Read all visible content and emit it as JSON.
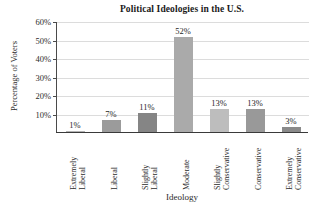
{
  "chart_data": {
    "type": "bar",
    "title": "Political Ideologies in the U.S.",
    "xlabel": "Ideology",
    "ylabel": "Percentage of Voters",
    "categories": [
      "Extremely Liberal",
      "Liberal",
      "Slightly Liberal",
      "Moderate",
      "Slightly Conservative",
      "Conservative",
      "Extremely Conservative"
    ],
    "category_lines": [
      [
        "Extremely",
        "Liberal"
      ],
      [
        "Liberal"
      ],
      [
        "Slightly",
        "Liberal"
      ],
      [
        "Moderate"
      ],
      [
        "Slightly",
        "Conservative"
      ],
      [
        "Conservative"
      ],
      [
        "Extremely",
        "Conservative"
      ]
    ],
    "values": [
      1,
      7,
      11,
      52,
      13,
      13,
      3
    ],
    "value_labels": [
      "1%",
      "7%",
      "11%",
      "52%",
      "13%",
      "13%",
      "3%"
    ],
    "bar_colors": [
      "#b4b4b4",
      "#9b9b9b",
      "#858585",
      "#aaaaaa",
      "#bdbdbd",
      "#999999",
      "#8a8a8a"
    ],
    "ylim": [
      0,
      60
    ],
    "yticks": [
      10,
      20,
      30,
      40,
      50,
      60
    ],
    "ytick_labels": [
      "10%",
      "20%",
      "30%",
      "40%",
      "50%",
      "60%"
    ],
    "grid": true,
    "legend": "none"
  }
}
